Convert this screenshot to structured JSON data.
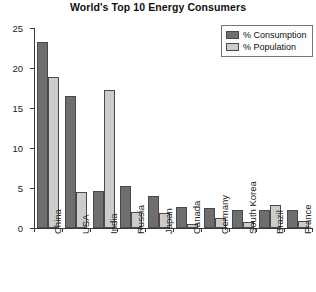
{
  "chart_data": {
    "type": "bar",
    "title": "World's Top 10 Energy Consumers",
    "xlabel": "",
    "ylabel": "Percentage",
    "ylim": [
      0,
      25
    ],
    "yticks": [
      0,
      5,
      10,
      15,
      20,
      25
    ],
    "grid": false,
    "legend_position": "top-right",
    "categories": [
      "China",
      "USA",
      "India",
      "Russia",
      "Japan",
      "Canada",
      "Germany",
      "South Korea",
      "Brazil",
      "France"
    ],
    "series": [
      {
        "name": "% Consumption",
        "color": "#6e6e6e",
        "values": [
          23.2,
          16.5,
          4.6,
          5.3,
          4.0,
          2.6,
          2.5,
          2.2,
          2.3,
          2.2
        ]
      },
      {
        "name": "% Population",
        "color": "#cccccc",
        "values": [
          18.9,
          4.5,
          17.3,
          2.0,
          1.9,
          0.5,
          1.2,
          0.7,
          2.9,
          0.9
        ]
      }
    ]
  }
}
